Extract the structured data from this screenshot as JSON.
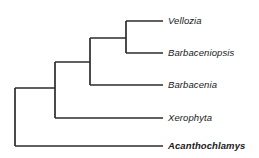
{
  "figure": {
    "kind": "cladogram",
    "background_color": "#ffffff",
    "line_color": "#2b2b2b",
    "text_color": "#1a1a1a",
    "width": 259,
    "height": 158
  },
  "taxa": [
    {
      "name": "Vellozia",
      "style": "italic",
      "tip_y": 21,
      "label_x": 168,
      "branch_start_x": 126,
      "branch_end_x": 163
    },
    {
      "name": "Barbaceniopsis",
      "style": "italic",
      "tip_y": 53,
      "label_x": 168,
      "branch_start_x": 126,
      "branch_end_x": 163
    },
    {
      "name": "Barbacenia",
      "style": "italic",
      "tip_y": 85,
      "label_x": 168,
      "branch_start_x": 90,
      "branch_end_x": 163
    },
    {
      "name": "Xerophyta",
      "style": "italic",
      "tip_y": 118,
      "label_x": 168,
      "branch_start_x": 55,
      "branch_end_x": 163
    },
    {
      "name": "Acanthochlamys",
      "style": "bold-italic",
      "tip_y": 146,
      "label_x": 168,
      "branch_start_x": 15,
      "branch_end_x": 163
    }
  ],
  "nodes": [
    {
      "id": "root",
      "x": 15,
      "y_top": 88,
      "y_bottom": 146
    },
    {
      "id": "node-2",
      "x": 55,
      "y_top": 62,
      "y_bottom": 118
    },
    {
      "id": "node-3",
      "x": 90,
      "y_top": 38,
      "y_bottom": 85
    },
    {
      "id": "node-4",
      "x": 126,
      "y_top": 21,
      "y_bottom": 53
    }
  ],
  "internal_branches": [
    {
      "id": "root-to-node-2",
      "x1": 15,
      "x2": 55,
      "y": 88
    },
    {
      "id": "node-2-to-node-3",
      "x1": 55,
      "x2": 90,
      "y": 62
    },
    {
      "id": "node-3-to-node-4",
      "x1": 90,
      "x2": 126,
      "y": 38
    }
  ],
  "chart_data": {
    "type": "diagram",
    "title": "",
    "topology": "(Acanthochlamys,(Xerophyta,(Barbacenia,(Vellozia,Barbaceniopsis))))",
    "leaf_order": [
      "Vellozia",
      "Barbaceniopsis",
      "Barbacenia",
      "Xerophyta",
      "Acanthochlamys"
    ],
    "highlighted_taxa": [
      "Acanthochlamys"
    ]
  }
}
